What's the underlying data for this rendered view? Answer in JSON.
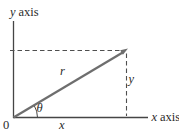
{
  "figure": {
    "type": "vector-components-diagram",
    "colors": {
      "axis": "#454545",
      "vector": "#6e6e6e",
      "dashed": "#4f4f4f",
      "text": "#2b2b2b",
      "background": "#ffffff"
    },
    "labels": {
      "y_axis_var": "y",
      "y_axis_word": "axis",
      "x_axis_var": "x",
      "x_axis_word": "axis",
      "origin": "0",
      "vector": "r",
      "angle": "θ",
      "x_component": "x",
      "y_component": "y"
    }
  }
}
